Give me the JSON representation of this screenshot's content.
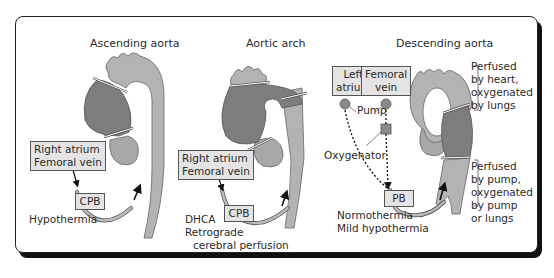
{
  "panels": [
    {
      "title": "Ascending aorta",
      "source_box": [
        "Right atrium",
        "Femoral vein"
      ],
      "pump_box": "CPB",
      "notes": [
        "Hypothermia"
      ]
    },
    {
      "title": "Aortic arch",
      "source_box": [
        "Right atrium",
        "Femoral vein"
      ],
      "pump_box": "CPB",
      "notes": [
        "DHCA",
        "Retrograde",
        "cerebral perfusion"
      ]
    },
    {
      "title": "Descending aorta",
      "source_boxes": [
        [
          "Left",
          "atrium"
        ],
        [
          "Femoral",
          "vein"
        ]
      ],
      "pump_label": "Pump",
      "oxygenator_label": "Oxygenator",
      "pump_box": "PB",
      "notes": [
        "Normothermia",
        "Mild hypothermia"
      ],
      "brackets": [
        [
          "Perfused",
          "by heart,",
          "oxygenated",
          "by lungs"
        ],
        [
          "Perfused",
          "by pump,",
          "oxygenated",
          "by pump",
          "or lungs"
        ]
      ]
    }
  ],
  "colors": {
    "aorta_light": "#b3b3b3",
    "aorta_dark": "#7d7d7d",
    "box_fill": "#e4e4e4",
    "outline": "#555555"
  }
}
